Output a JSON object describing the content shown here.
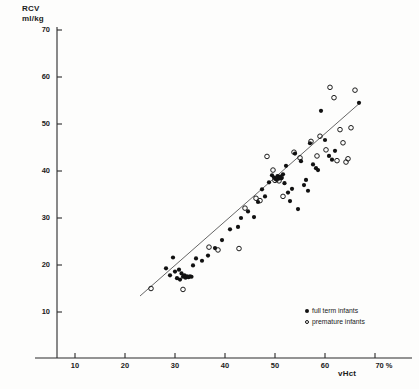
{
  "chart_data": {
    "type": "scatter",
    "title": "",
    "ylabel": "RCV\nml/kg",
    "xlabel": "vHct",
    "xunit": "%",
    "xlim": [
      4,
      73
    ],
    "ylim": [
      7,
      72
    ],
    "xticks": [
      10,
      20,
      30,
      40,
      50,
      60,
      70
    ],
    "yticks": [
      10,
      20,
      30,
      40,
      50,
      60,
      70
    ],
    "grid": false,
    "legend_position": "bottom-right",
    "legend": [
      {
        "marker": "filled-circle",
        "label": "full term infants"
      },
      {
        "marker": "open-circle",
        "label": "premature infants"
      }
    ],
    "regression_line": {
      "x": [
        23.0,
        67.0
      ],
      "y": [
        13.4,
        54.5
      ]
    },
    "series": [
      {
        "name": "full term infants",
        "marker": "filled-circle",
        "points": [
          [
            28.2,
            19.3
          ],
          [
            29.0,
            17.8
          ],
          [
            29.6,
            21.6
          ],
          [
            30.0,
            18.6
          ],
          [
            30.4,
            17.2
          ],
          [
            30.8,
            19.0
          ],
          [
            31.0,
            16.9
          ],
          [
            31.3,
            18.2
          ],
          [
            31.6,
            17.5
          ],
          [
            31.9,
            17.8
          ],
          [
            32.1,
            17.3
          ],
          [
            32.4,
            17.6
          ],
          [
            32.7,
            17.4
          ],
          [
            33.0,
            17.6
          ],
          [
            33.3,
            17.5
          ],
          [
            33.6,
            19.9
          ],
          [
            34.2,
            21.4
          ],
          [
            35.4,
            20.9
          ],
          [
            36.6,
            22.0
          ],
          [
            38.0,
            23.6
          ],
          [
            39.4,
            25.3
          ],
          [
            41.0,
            27.6
          ],
          [
            42.6,
            28.1
          ],
          [
            43.2,
            30.0
          ],
          [
            44.6,
            31.4
          ],
          [
            45.8,
            30.2
          ],
          [
            46.6,
            33.4
          ],
          [
            47.4,
            36.1
          ],
          [
            48.0,
            34.6
          ],
          [
            48.8,
            37.6
          ],
          [
            49.4,
            39.1
          ],
          [
            49.8,
            38.6
          ],
          [
            50.2,
            38.2
          ],
          [
            50.5,
            38.9
          ],
          [
            50.8,
            38.4
          ],
          [
            51.0,
            38.8
          ],
          [
            51.3,
            38.5
          ],
          [
            51.6,
            39.3
          ],
          [
            51.9,
            37.4
          ],
          [
            52.2,
            41.1
          ],
          [
            52.6,
            35.4
          ],
          [
            53.0,
            33.6
          ],
          [
            53.4,
            36.2
          ],
          [
            54.0,
            43.7
          ],
          [
            54.6,
            31.9
          ],
          [
            55.2,
            42.1
          ],
          [
            55.8,
            37.0
          ],
          [
            56.2,
            38.1
          ],
          [
            56.6,
            35.8
          ],
          [
            57.0,
            45.9
          ],
          [
            57.6,
            41.4
          ],
          [
            58.2,
            40.6
          ],
          [
            58.6,
            40.2
          ],
          [
            59.2,
            52.8
          ],
          [
            60.0,
            46.6
          ],
          [
            60.8,
            43.2
          ],
          [
            61.4,
            42.4
          ],
          [
            62.0,
            44.3
          ],
          [
            66.8,
            54.5
          ]
        ]
      },
      {
        "name": "premature infants",
        "marker": "open-circle",
        "points": [
          [
            25.2,
            15.0
          ],
          [
            31.6,
            14.8
          ],
          [
            36.8,
            23.8
          ],
          [
            38.6,
            23.2
          ],
          [
            42.8,
            23.5
          ],
          [
            44.0,
            32.1
          ],
          [
            46.2,
            34.2
          ],
          [
            47.0,
            33.7
          ],
          [
            48.4,
            43.1
          ],
          [
            49.6,
            40.2
          ],
          [
            50.0,
            38.0
          ],
          [
            50.4,
            38.3
          ],
          [
            50.8,
            37.9
          ],
          [
            51.2,
            38.6
          ],
          [
            51.6,
            34.6
          ],
          [
            53.8,
            44.0
          ],
          [
            55.0,
            42.8
          ],
          [
            57.2,
            46.3
          ],
          [
            58.4,
            43.2
          ],
          [
            59.0,
            47.4
          ],
          [
            60.2,
            44.5
          ],
          [
            61.0,
            57.8
          ],
          [
            61.8,
            55.6
          ],
          [
            62.4,
            42.2
          ],
          [
            63.0,
            48.8
          ],
          [
            63.6,
            46.0
          ],
          [
            64.2,
            41.9
          ],
          [
            64.6,
            42.6
          ],
          [
            65.2,
            49.2
          ],
          [
            66.0,
            57.2
          ]
        ]
      }
    ]
  }
}
